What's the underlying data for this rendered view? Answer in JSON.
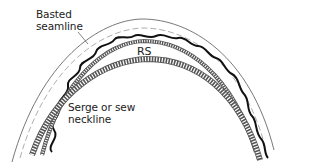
{
  "diagram": {
    "labels": {
      "basted_seamline": [
        "Basted",
        "seamline"
      ],
      "right_side": "RS",
      "serge_neckline": [
        "Serge or sew",
        "neckline"
      ]
    },
    "colors": {
      "ink": "#111111",
      "outline": "#555555",
      "serge": "#666666",
      "background": "#ffffff"
    }
  }
}
